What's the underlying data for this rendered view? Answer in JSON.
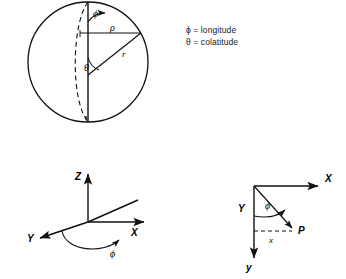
{
  "figure": {
    "title_caption": "",
    "bottom_caption_fragment": "",
    "colors": {
      "ink": "#111111",
      "background": "#ffffff",
      "faded_caption": "#d2d2d2"
    }
  },
  "legend": {
    "lines": [
      {
        "symbol": "ϕ",
        "equals": "=",
        "meaning": "longitude"
      },
      {
        "symbol": "θ",
        "equals": "=",
        "meaning": "colatitude"
      }
    ],
    "line_1_text": "ϕ = longitude",
    "line_2_text": "θ = colatitude"
  },
  "sphere_diagram": {
    "name": "spherical-coordinates-sphere",
    "labels": {
      "phi": "ϕ",
      "rho": "ρ",
      "theta": "θ",
      "r": "r"
    },
    "geometry": {
      "center_x": 88,
      "center_y": 62,
      "radius": 60,
      "polar_axis_top_y": 2,
      "polar_axis_bottom_y": 122,
      "rho_segment_y": 33,
      "rho_segment_x_end": 140,
      "r_line_end_x": 141,
      "r_line_end_y": 33
    }
  },
  "axes_diagram_left": {
    "name": "xyz-axes-longitude",
    "labels": {
      "z": "Z",
      "x": "X",
      "y": "Y",
      "phi": "ϕ"
    },
    "origin": {
      "x": 88,
      "y": 222
    }
  },
  "axes_diagram_right": {
    "name": "screen-coordinates-point-p",
    "labels": {
      "x_axis": "X",
      "y_axis": "y",
      "radial": "Y",
      "phi": "ϕ",
      "horizontal_component": "x",
      "point": "P"
    },
    "origin": {
      "x": 254,
      "y": 186
    }
  }
}
